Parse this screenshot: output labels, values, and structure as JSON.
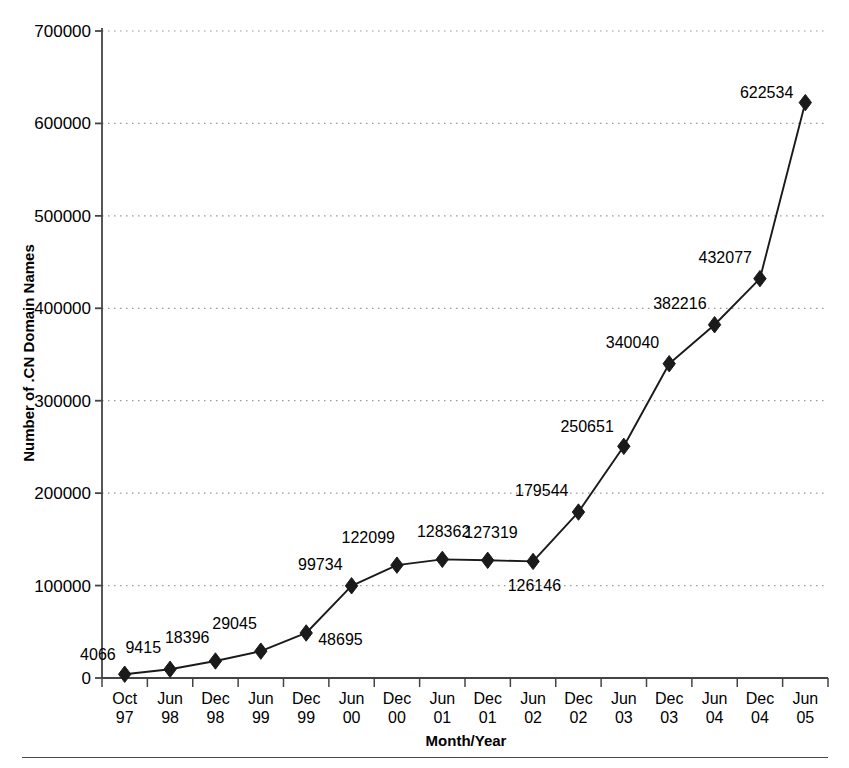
{
  "chart_data": {
    "type": "line",
    "title": "",
    "xlabel": "Month/Year",
    "ylabel": "Number of .CN Domain Names",
    "categories": [
      "Oct 97",
      "Jun 98",
      "Dec 98",
      "Jun 99",
      "Dec 99",
      "Jun 00",
      "Dec 00",
      "Jun 01",
      "Dec 01",
      "Jun 02",
      "Dec 02",
      "Jun 03",
      "Dec 03",
      "Jun 04",
      "Dec 04",
      "Jun 05"
    ],
    "category_lines": [
      [
        "Oct",
        "97"
      ],
      [
        "Jun",
        "98"
      ],
      [
        "Dec",
        "98"
      ],
      [
        "Jun",
        "99"
      ],
      [
        "Dec",
        "99"
      ],
      [
        "Jun",
        "00"
      ],
      [
        "Dec",
        "00"
      ],
      [
        "Jun",
        "01"
      ],
      [
        "Dec",
        "01"
      ],
      [
        "Jun",
        "02"
      ],
      [
        "Dec",
        "02"
      ],
      [
        "Jun",
        "03"
      ],
      [
        "Dec",
        "03"
      ],
      [
        "Jun",
        "04"
      ],
      [
        "Dec",
        "04"
      ],
      [
        "Jun",
        "05"
      ]
    ],
    "values": [
      4066,
      9415,
      18396,
      29045,
      48695,
      99734,
      122099,
      128362,
      127319,
      126146,
      179544,
      250651,
      340040,
      382216,
      432077,
      622534
    ],
    "point_labels": [
      "4066",
      "9415",
      "18396",
      "29045",
      "48695",
      "99734",
      "122099",
      "128362",
      "127319",
      "126146",
      "179544",
      "250651",
      "340040",
      "382216",
      "432077",
      "622534"
    ],
    "ylim": [
      0,
      700000
    ],
    "ytick_values": [
      0,
      100000,
      200000,
      300000,
      400000,
      500000,
      600000,
      700000
    ],
    "ytick_labels": [
      "0",
      "100000",
      "200000",
      "300000",
      "400000",
      "500000",
      "600000",
      "700000"
    ],
    "grid": "horizontal-dotted",
    "legend": "none",
    "series_color": "#1a1a1a",
    "marker": "diamond",
    "marker_color": "#1a1a1a",
    "axis_color": "#444444",
    "grid_color": "#999999",
    "background": "#ffffff"
  }
}
